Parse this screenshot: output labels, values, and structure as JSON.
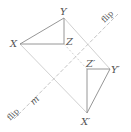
{
  "diagram": {
    "type": "reflection",
    "colors": {
      "triangle": "#8a8a8a",
      "guide": "#c4c4c4",
      "mirror": "#bdbdbd",
      "label": "#555555"
    },
    "mirror_line": {
      "label": "m",
      "flip_label_top": "flip",
      "flip_label_bottom": "flip"
    },
    "original_triangle": {
      "vertices": [
        {
          "name": "X",
          "label": "X",
          "x": 20,
          "y": 44
        },
        {
          "name": "Y",
          "label": "Y",
          "x": 64,
          "y": 18
        },
        {
          "name": "Z",
          "label": "Z",
          "x": 64,
          "y": 44
        }
      ]
    },
    "image_triangle": {
      "vertices": [
        {
          "name": "X'",
          "label": "X′",
          "x": 87,
          "y": 113
        },
        {
          "name": "Y'",
          "label": "Y′",
          "x": 110,
          "y": 69
        },
        {
          "name": "Z'",
          "label": "Z′",
          "x": 87,
          "y": 69
        }
      ]
    }
  }
}
